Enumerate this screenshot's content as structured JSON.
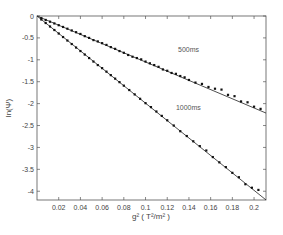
{
  "chart_data": {
    "type": "scatter",
    "title": "",
    "xlabel": "g² ( T²/m² )",
    "ylabel": "ln(Ψ)",
    "xlim": [
      0,
      0.211
    ],
    "ylim": [
      -4.2,
      0
    ],
    "xticks": [
      0.02,
      0.04,
      0.06,
      0.08,
      0.1,
      0.12,
      0.14,
      0.16,
      0.18,
      0.2
    ],
    "xtick_labels": [
      "0.02",
      "0.04",
      "0.06",
      "0.08",
      "0.1",
      "0.12",
      "0.14",
      "0.16",
      "0.18",
      "0.2"
    ],
    "yticks": [
      0,
      -0.5,
      -1,
      -1.5,
      -2,
      -2.5,
      -3,
      -3.5,
      -4
    ],
    "ytick_labels": [
      "0",
      "-0.5",
      "-1",
      "-1.5",
      "-2",
      "-2.5",
      "-3",
      "-3.5",
      "-4"
    ],
    "grid": false,
    "series": [
      {
        "name": "500ms",
        "fit_slope": -10.5,
        "x": [
          0.004,
          0.008,
          0.012,
          0.016,
          0.02,
          0.024,
          0.028,
          0.032,
          0.036,
          0.04,
          0.044,
          0.048,
          0.052,
          0.056,
          0.06,
          0.064,
          0.068,
          0.072,
          0.076,
          0.08,
          0.084,
          0.088,
          0.092,
          0.096,
          0.1,
          0.104,
          0.108,
          0.112,
          0.116,
          0.12,
          0.124,
          0.128,
          0.132,
          0.136,
          0.14,
          0.146,
          0.152,
          0.158,
          0.164,
          0.17,
          0.176,
          0.182,
          0.188,
          0.194,
          0.2,
          0.206
        ],
        "y": [
          -0.05,
          -0.09,
          -0.13,
          -0.17,
          -0.21,
          -0.25,
          -0.29,
          -0.33,
          -0.37,
          -0.41,
          -0.46,
          -0.5,
          -0.55,
          -0.58,
          -0.62,
          -0.66,
          -0.71,
          -0.75,
          -0.8,
          -0.84,
          -0.89,
          -0.93,
          -0.96,
          -0.99,
          -1.04,
          -1.08,
          -1.12,
          -1.16,
          -1.22,
          -1.25,
          -1.3,
          -1.32,
          -1.37,
          -1.4,
          -1.46,
          -1.52,
          -1.55,
          -1.62,
          -1.66,
          -1.68,
          -1.8,
          -1.83,
          -1.95,
          -1.97,
          -2.07,
          -2.12
        ]
      },
      {
        "name": "1000ms",
        "fit_slope": -19.9,
        "x": [
          0.004,
          0.008,
          0.012,
          0.016,
          0.02,
          0.024,
          0.028,
          0.032,
          0.036,
          0.04,
          0.044,
          0.048,
          0.052,
          0.056,
          0.06,
          0.064,
          0.068,
          0.072,
          0.076,
          0.08,
          0.085,
          0.09,
          0.095,
          0.1,
          0.105,
          0.11,
          0.115,
          0.12,
          0.126,
          0.132,
          0.138,
          0.144,
          0.15,
          0.156,
          0.162,
          0.168,
          0.174,
          0.18,
          0.186,
          0.192,
          0.198,
          0.204
        ],
        "y": [
          -0.08,
          -0.16,
          -0.24,
          -0.32,
          -0.4,
          -0.48,
          -0.56,
          -0.64,
          -0.72,
          -0.8,
          -0.88,
          -0.96,
          -1.04,
          -1.12,
          -1.19,
          -1.27,
          -1.35,
          -1.43,
          -1.51,
          -1.59,
          -1.69,
          -1.79,
          -1.89,
          -1.99,
          -2.08,
          -2.18,
          -2.28,
          -2.38,
          -2.5,
          -2.63,
          -2.74,
          -2.86,
          -2.97,
          -3.07,
          -3.22,
          -3.34,
          -3.45,
          -3.58,
          -3.68,
          -3.84,
          -3.92,
          -3.97
        ]
      }
    ],
    "annotations": [
      {
        "text": "500ms",
        "x": 0.13,
        "y": -0.83
      },
      {
        "text": "1000ms",
        "x": 0.128,
        "y": -2.15
      }
    ]
  }
}
